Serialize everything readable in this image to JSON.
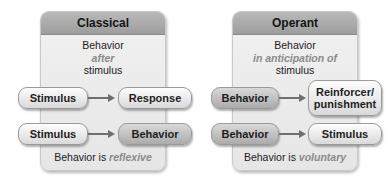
{
  "classical": {
    "title": "Classical",
    "description": {
      "line1": "Behavior",
      "line2": "after",
      "line3": "stimulus"
    },
    "row1": {
      "from": "Stimulus",
      "to": "Response"
    },
    "row2": {
      "from": "Stimulus",
      "to": "Behavior"
    },
    "footer": {
      "prefix": "Behavior is ",
      "emphasis": "reflexive"
    }
  },
  "operant": {
    "title": "Operant",
    "description": {
      "line1": "Behavior",
      "line2": "in anticipation of",
      "line3": "stimulus"
    },
    "row1": {
      "from": "Behavior",
      "to": "Reinforcer/ punishment"
    },
    "row2": {
      "from": "Behavior",
      "to": "Stimulus"
    },
    "footer": {
      "prefix": "Behavior is ",
      "emphasis": "voluntary"
    }
  },
  "colors": {
    "header": "#a8a8a8",
    "panel": "#ececec",
    "emphasis_text": "#8a8a8a",
    "arrow": "#6f6f6f"
  }
}
